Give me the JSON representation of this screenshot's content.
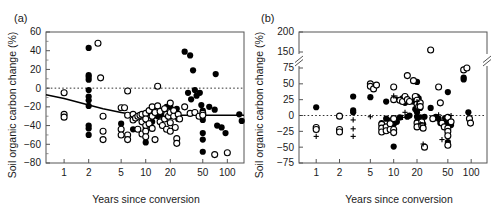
{
  "figure": {
    "panels": [
      {
        "id": "a",
        "label": "(a)",
        "xlabel": "Years since conversion",
        "ylabel": "Soil organic carbon change (%)"
      },
      {
        "id": "b",
        "label": "(b)",
        "xlabel": "Years since conversion",
        "ylabel": "Soil organic carbon change (%)"
      }
    ]
  },
  "chart_data": [
    {
      "type": "scatter",
      "panel": "(a)",
      "title": "",
      "xlabel": "Years since conversion",
      "ylabel": "Soil organic carbon change (%)",
      "xscale": "log",
      "xlim": [
        0.6,
        160
      ],
      "ylim": [
        -80,
        60
      ],
      "xticks": [
        1,
        2,
        5,
        10,
        20,
        50,
        100
      ],
      "xticklabels": [
        "1",
        "2",
        "5",
        "10",
        "20",
        "50",
        "100"
      ],
      "yticks": [
        60,
        40,
        20,
        0,
        -20,
        -40,
        -60,
        -80
      ],
      "yticklabels": [
        "60",
        "40",
        "20",
        "0",
        "-20",
        "-40",
        "-60",
        "-80"
      ],
      "grid": false,
      "legend": null,
      "annotations": [
        {
          "kind": "zero-line",
          "style": "dotted",
          "y": 0
        },
        {
          "kind": "fitted-curve",
          "style": "solid",
          "points": [
            [
              0.6,
              -7
            ],
            [
              1,
              -11
            ],
            [
              2,
              -18
            ],
            [
              3,
              -22
            ],
            [
              5,
              -26
            ],
            [
              8,
              -29
            ],
            [
              10,
              -29
            ],
            [
              20,
              -29
            ],
            [
              50,
              -29
            ],
            [
              100,
              -29
            ],
            [
              160,
              -29
            ]
          ]
        }
      ],
      "series": [
        {
          "name": "filled-circle",
          "marker": "filled circle",
          "points": [
            [
              2,
              43
            ],
            [
              2,
              14
            ],
            [
              2,
              12
            ],
            [
              2,
              9
            ],
            [
              2,
              -2
            ],
            [
              2,
              -9
            ],
            [
              2,
              -13
            ],
            [
              2,
              -19
            ],
            [
              2,
              -40
            ],
            [
              2,
              -43
            ],
            [
              2,
              -50
            ],
            [
              5,
              -38
            ],
            [
              7,
              -44
            ],
            [
              9,
              -36
            ],
            [
              10,
              -58
            ],
            [
              10,
              -44
            ],
            [
              10,
              -29
            ],
            [
              12,
              -36
            ],
            [
              14,
              -30
            ],
            [
              16,
              -29
            ],
            [
              18,
              -20
            ],
            [
              20,
              -20
            ],
            [
              22,
              -29
            ],
            [
              24,
              -22
            ],
            [
              25,
              -33
            ],
            [
              30,
              39
            ],
            [
              33,
              -5
            ],
            [
              35,
              35
            ],
            [
              36,
              -12
            ],
            [
              38,
              19
            ],
            [
              40,
              -2
            ],
            [
              42,
              -8
            ],
            [
              46,
              -5
            ],
            [
              48,
              -18
            ],
            [
              50,
              -24
            ],
            [
              50,
              -29
            ],
            [
              50,
              -34
            ],
            [
              50,
              -48
            ],
            [
              50,
              -55
            ],
            [
              50,
              -68
            ],
            [
              60,
              -20
            ],
            [
              70,
              -23
            ],
            [
              72,
              15
            ],
            [
              75,
              -40
            ],
            [
              85,
              -42
            ],
            [
              95,
              -48
            ],
            [
              140,
              -28
            ],
            [
              150,
              -35
            ]
          ]
        },
        {
          "name": "open-circle",
          "marker": "open circle",
          "points": [
            [
              1,
              -5
            ],
            [
              1,
              -28
            ],
            [
              1,
              -31
            ],
            [
              2.6,
              48
            ],
            [
              2.8,
              11
            ],
            [
              3,
              -30
            ],
            [
              3,
              -46
            ],
            [
              3,
              -55
            ],
            [
              5,
              -21
            ],
            [
              5,
              -44
            ],
            [
              5,
              -50
            ],
            [
              5.5,
              -21
            ],
            [
              6,
              -3
            ],
            [
              6,
              -29
            ],
            [
              6,
              -50
            ],
            [
              6,
              -55
            ],
            [
              7,
              -28
            ],
            [
              7,
              -34
            ],
            [
              7.5,
              -32
            ],
            [
              8,
              -30
            ],
            [
              8,
              -44
            ],
            [
              8.5,
              -29
            ],
            [
              9,
              -28
            ],
            [
              9,
              -36
            ],
            [
              9,
              -49
            ],
            [
              10,
              -27
            ],
            [
              10,
              -33
            ],
            [
              10,
              -40
            ],
            [
              10,
              -46
            ],
            [
              10,
              -52
            ],
            [
              11,
              -24
            ],
            [
              11,
              -38
            ],
            [
              12,
              -20
            ],
            [
              12,
              -30
            ],
            [
              12,
              -43
            ],
            [
              13,
              -26
            ],
            [
              13,
              -55
            ],
            [
              14,
              2
            ],
            [
              14,
              -19
            ],
            [
              15,
              -25
            ],
            [
              15,
              -36
            ],
            [
              16,
              -40
            ],
            [
              17,
              -22
            ],
            [
              17,
              -33
            ],
            [
              18,
              -28
            ],
            [
              18,
              -44
            ],
            [
              19,
              -30
            ],
            [
              20,
              -16
            ],
            [
              20,
              -26
            ],
            [
              20,
              -37
            ],
            [
              20,
              -46
            ],
            [
              22,
              -24
            ],
            [
              22,
              -30
            ],
            [
              23,
              -42
            ],
            [
              24,
              -54
            ],
            [
              24,
              -59
            ],
            [
              25,
              -28
            ],
            [
              26,
              -33
            ],
            [
              30,
              -20
            ],
            [
              35,
              -27
            ],
            [
              40,
              -26
            ],
            [
              45,
              -30
            ],
            [
              50,
              -27
            ],
            [
              50,
              -29
            ],
            [
              70,
              -71
            ],
            [
              100,
              -69
            ]
          ]
        }
      ]
    },
    {
      "type": "scatter",
      "panel": "(b)",
      "title": "",
      "xlabel": "Years since conversion",
      "ylabel": "Soil organic carbon change (%)",
      "xscale": "log",
      "xlim": [
        0.6,
        160
      ],
      "ylim": [
        -75,
        200
      ],
      "axis_break": {
        "between": [
          75,
          150
        ],
        "style": "double-slash"
      },
      "xticks": [
        1,
        2,
        5,
        10,
        20,
        50,
        100
      ],
      "xticklabels": [
        "1",
        "2",
        "5",
        "10",
        "20",
        "50",
        "100"
      ],
      "yticks": [
        200,
        150,
        75,
        50,
        25,
        0,
        -25,
        -50,
        -75
      ],
      "yticklabels": [
        "200",
        "150",
        "75",
        "50",
        "25",
        "0",
        "-25",
        "-50",
        "-75"
      ],
      "grid": false,
      "legend": null,
      "annotations": [
        {
          "kind": "zero-line",
          "style": "dotted",
          "y": 0
        }
      ],
      "series": [
        {
          "name": "filled-circle",
          "marker": "filled circle",
          "points": [
            [
              1,
              13
            ],
            [
              3,
              30
            ],
            [
              3,
              8
            ],
            [
              3,
              5
            ],
            [
              5,
              29
            ],
            [
              7,
              -12
            ],
            [
              8,
              22
            ],
            [
              8,
              -5
            ],
            [
              9,
              -8
            ],
            [
              9,
              -20
            ],
            [
              10,
              -6
            ],
            [
              10,
              -49
            ],
            [
              10,
              -14
            ],
            [
              11,
              -10
            ],
            [
              12,
              -3
            ],
            [
              13,
              27
            ],
            [
              14,
              20
            ],
            [
              15,
              -2
            ],
            [
              16,
              0
            ],
            [
              18,
              22
            ],
            [
              19,
              25
            ],
            [
              19,
              10
            ],
            [
              20,
              53
            ],
            [
              20,
              30
            ],
            [
              20,
              18
            ],
            [
              20,
              5
            ],
            [
              20,
              -2
            ],
            [
              20,
              -10
            ],
            [
              21,
              27
            ],
            [
              22,
              12
            ],
            [
              22,
              -3
            ],
            [
              23,
              -8
            ],
            [
              24,
              -14
            ],
            [
              25,
              -2
            ],
            [
              30,
              155
            ],
            [
              30,
              12
            ],
            [
              35,
              -2
            ],
            [
              38,
              -5
            ],
            [
              40,
              -12
            ],
            [
              46,
              -4
            ],
            [
              48,
              -10
            ],
            [
              50,
              37
            ],
            [
              50,
              -6
            ],
            [
              50,
              -14
            ],
            [
              50,
              -18
            ],
            [
              50,
              -22
            ],
            [
              50,
              -28
            ],
            [
              50,
              -42
            ],
            [
              55,
              -15
            ],
            [
              80,
              60
            ],
            [
              80,
              57
            ],
            [
              92,
              5
            ]
          ]
        },
        {
          "name": "open-circle",
          "marker": "open circle",
          "points": [
            [
              1,
              -19
            ],
            [
              1,
              -22
            ],
            [
              2,
              -1
            ],
            [
              2,
              -22
            ],
            [
              2,
              -26
            ],
            [
              5,
              50
            ],
            [
              5,
              46
            ],
            [
              5.5,
              42
            ],
            [
              6,
              48
            ],
            [
              7,
              -14
            ],
            [
              7,
              -20
            ],
            [
              7,
              -26
            ],
            [
              8,
              -18
            ],
            [
              8,
              -24
            ],
            [
              9,
              -13
            ],
            [
              9,
              -22
            ],
            [
              10,
              45
            ],
            [
              10,
              25
            ],
            [
              10,
              -5
            ],
            [
              10,
              -22
            ],
            [
              10,
              -27
            ],
            [
              12,
              24
            ],
            [
              13,
              22
            ],
            [
              14,
              30
            ],
            [
              15,
              63
            ],
            [
              15,
              25
            ],
            [
              16,
              22
            ],
            [
              18,
              55
            ],
            [
              19,
              30
            ],
            [
              20,
              24
            ],
            [
              20,
              18
            ],
            [
              20,
              -12
            ],
            [
              20,
              -18
            ],
            [
              21,
              14
            ],
            [
              22,
              20
            ],
            [
              22,
              14
            ],
            [
              23,
              -10
            ],
            [
              23,
              -16
            ],
            [
              24,
              -20
            ],
            [
              25,
              -50
            ],
            [
              30,
              155
            ],
            [
              32,
              -5
            ],
            [
              38,
              45
            ],
            [
              40,
              20
            ],
            [
              42,
              -12
            ],
            [
              45,
              -18
            ],
            [
              50,
              -3
            ],
            [
              50,
              -20
            ],
            [
              50,
              -25
            ],
            [
              50,
              -32
            ],
            [
              50,
              -47
            ],
            [
              55,
              -10
            ],
            [
              80,
              72
            ],
            [
              88,
              75
            ],
            [
              95,
              -5
            ],
            [
              98,
              -12
            ]
          ]
        },
        {
          "name": "plus",
          "marker": "plus",
          "points": [
            [
              1,
              -33
            ],
            [
              3,
              -7
            ],
            [
              3,
              -21
            ],
            [
              3,
              -33
            ],
            [
              5,
              -2
            ],
            [
              10,
              31
            ],
            [
              11,
              28
            ],
            [
              13,
              -3
            ],
            [
              14,
              5
            ],
            [
              20,
              22
            ],
            [
              22,
              -13
            ],
            [
              24,
              -45
            ],
            [
              38,
              1
            ],
            [
              42,
              -38
            ],
            [
              55,
              0
            ]
          ]
        }
      ]
    }
  ]
}
